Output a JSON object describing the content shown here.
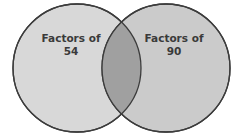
{
  "diagram": {
    "type": "venn",
    "sets": [
      {
        "label_line1": "Factors of",
        "label_line2": "54",
        "fill": "#d6d6d6"
      },
      {
        "label_line1": "Factors of",
        "label_line2": "90",
        "fill": "#c9c9c9"
      }
    ],
    "intersection_fill": "#9e9e9e",
    "stroke": "#3c3c3c"
  }
}
